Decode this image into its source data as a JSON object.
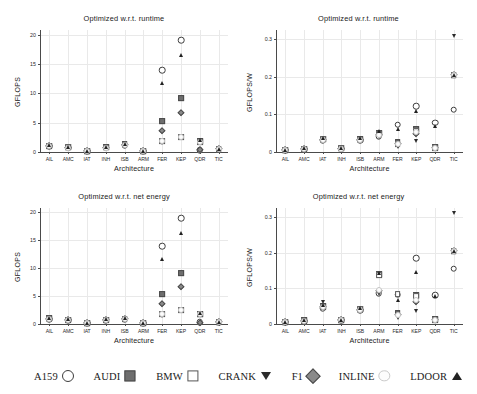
{
  "figure": {
    "width": 477,
    "height": 394,
    "xlabel": "Architecture",
    "categories": [
      "AIL",
      "AMC",
      "IAT",
      "INH",
      "ISB",
      "ARM",
      "FER",
      "KEP",
      "QDR",
      "TIC"
    ],
    "series_names": [
      "A159",
      "AUDI",
      "BMW",
      "CRANK",
      "F1",
      "INLINE",
      "LDOOR"
    ],
    "markers": {
      "A159": "open-circle",
      "AUDI": "gray-square",
      "BMW": "white-square",
      "CRANK": "filled-down-triangle",
      "F1": "gray-diamond",
      "INLINE": "white-circle",
      "LDOOR": "filled-up-triangle"
    },
    "colors": {
      "open_circle": "#ffffff",
      "open_circle_edge": "#3d3d3d",
      "gray_square": "#6e6e6e",
      "white_square": "#ffffff",
      "down_triangle": "#2b2b2b",
      "diamond": "#8a8a8a",
      "inline": "#fdfdfd",
      "up_triangle": "#222222",
      "grid": "#e9e9e9",
      "axis": "#4a4a4a",
      "text": "#1a1a1a"
    }
  },
  "legend": {
    "items": [
      {
        "label": "A159",
        "marker": "open-circle"
      },
      {
        "label": "AUDI",
        "marker": "gray-square"
      },
      {
        "label": "BMW",
        "marker": "white-square"
      },
      {
        "label": "CRANK",
        "marker": "filled-down-triangle"
      },
      {
        "label": "F1",
        "marker": "gray-diamond"
      },
      {
        "label": "INLINE",
        "marker": "white-circle"
      },
      {
        "label": "LDOOR",
        "marker": "filled-up-triangle"
      }
    ]
  },
  "chart_data": [
    {
      "id": "top-left",
      "type": "scatter",
      "title": "Optimized w.r.t. runtime",
      "xlabel": "Architecture",
      "ylabel": "GFLOPS",
      "categories": [
        "AIL",
        "AMC",
        "IAT",
        "INH",
        "ISB",
        "ARM",
        "FER",
        "KEP",
        "QDR",
        "TIC"
      ],
      "ylim": [
        0,
        20.8
      ],
      "yticks": [
        0,
        5,
        10,
        15,
        20
      ],
      "ytick_labels": [
        "0",
        "5",
        "10",
        "15",
        "20"
      ],
      "grid": true,
      "legend_position": "below-figure",
      "series": [
        {
          "name": "A159",
          "values": [
            1.0,
            0.75,
            0.15,
            0.7,
            1.2,
            0.12,
            13.9,
            19.1,
            0.35,
            0.55
          ]
        },
        {
          "name": "AUDI",
          "values": [
            1.1,
            0.8,
            0.2,
            0.8,
            1.3,
            0.15,
            5.3,
            9.2,
            1.8,
            0.5
          ]
        },
        {
          "name": "BMW",
          "values": [
            1.05,
            0.78,
            0.18,
            0.75,
            1.25,
            0.14,
            1.9,
            2.6,
            1.7,
            0.45
          ]
        },
        {
          "name": "CRANK",
          "values": [
            0.9,
            0.7,
            0.12,
            0.65,
            1.1,
            0.1,
            1.55,
            2.45,
            0.3,
            0.6
          ]
        },
        {
          "name": "F1",
          "values": [
            1.0,
            0.75,
            0.15,
            0.7,
            1.2,
            0.12,
            3.6,
            6.7,
            0.3,
            0.5
          ]
        },
        {
          "name": "INLINE",
          "values": [
            1.0,
            0.75,
            0.15,
            0.7,
            1.2,
            0.12,
            1.85,
            2.5,
            1.75,
            0.5
          ]
        },
        {
          "name": "LDOOR",
          "values": [
            1.15,
            0.85,
            0.2,
            0.8,
            1.4,
            0.15,
            11.7,
            16.5,
            2.0,
            0.5
          ]
        }
      ]
    },
    {
      "id": "top-right",
      "type": "scatter",
      "title": "Optimized w.r.t. runtime",
      "xlabel": "Architecture",
      "ylabel": "GFLOPS/W",
      "categories": [
        "AIL",
        "AMC",
        "IAT",
        "INH",
        "ISB",
        "ARM",
        "FER",
        "KEP",
        "QDR",
        "TIC"
      ],
      "ylim": [
        0,
        0.325
      ],
      "yticks": [
        0,
        0.1,
        0.2,
        0.3
      ],
      "ytick_labels": [
        "0",
        "0.1",
        "0.2",
        "0.3"
      ],
      "grid": true,
      "legend_position": "below-figure",
      "series": [
        {
          "name": "A159",
          "values": [
            0.004,
            0.007,
            0.032,
            0.009,
            0.031,
            0.042,
            0.073,
            0.122,
            0.078,
            0.113
          ]
        },
        {
          "name": "AUDI",
          "values": [
            0.005,
            0.009,
            0.035,
            0.01,
            0.034,
            0.051,
            0.027,
            0.06,
            0.012,
            0.205
          ]
        },
        {
          "name": "BMW",
          "values": [
            0.005,
            0.008,
            0.034,
            0.01,
            0.033,
            0.049,
            0.022,
            0.055,
            0.011,
            0.205
          ]
        },
        {
          "name": "CRANK",
          "values": [
            0.004,
            0.007,
            0.031,
            0.008,
            0.03,
            0.04,
            0.012,
            0.028,
            0.008,
            0.31
          ]
        },
        {
          "name": "F1",
          "values": [
            0.004,
            0.008,
            0.033,
            0.009,
            0.032,
            0.045,
            0.02,
            0.047,
            0.01,
            0.205
          ]
        },
        {
          "name": "INLINE",
          "values": [
            0.004,
            0.008,
            0.033,
            0.009,
            0.032,
            0.046,
            0.021,
            0.052,
            0.01,
            0.205
          ]
        },
        {
          "name": "LDOOR",
          "values": [
            0.006,
            0.01,
            0.037,
            0.011,
            0.036,
            0.055,
            0.06,
            0.108,
            0.07,
            0.205
          ]
        }
      ]
    },
    {
      "id": "bottom-left",
      "type": "scatter",
      "title": "Optimized w.r.t. net energy",
      "xlabel": "Architecture",
      "ylabel": "GFLOPS",
      "categories": [
        "AIL",
        "AMC",
        "IAT",
        "INH",
        "ISB",
        "ARM",
        "FER",
        "KEP",
        "QDR",
        "TIC"
      ],
      "ylim": [
        0,
        20.8
      ],
      "yticks": [
        0,
        5,
        10,
        15,
        20
      ],
      "ytick_labels": [
        "0",
        "5",
        "10",
        "15",
        "20"
      ],
      "grid": true,
      "legend_position": "below-figure",
      "series": [
        {
          "name": "A159",
          "values": [
            0.9,
            0.7,
            0.15,
            0.7,
            0.85,
            0.12,
            13.9,
            19.0,
            0.3,
            0.35
          ]
        },
        {
          "name": "AUDI",
          "values": [
            1.0,
            0.8,
            0.2,
            0.8,
            0.95,
            0.16,
            5.3,
            9.1,
            1.8,
            0.4
          ]
        },
        {
          "name": "BMW",
          "values": [
            0.95,
            0.75,
            0.18,
            0.75,
            0.9,
            0.15,
            1.8,
            2.5,
            1.7,
            0.35
          ]
        },
        {
          "name": "CRANK",
          "values": [
            0.85,
            0.68,
            0.12,
            0.65,
            0.8,
            0.1,
            1.5,
            2.4,
            0.25,
            0.4
          ]
        },
        {
          "name": "F1",
          "values": [
            0.9,
            0.7,
            0.15,
            0.7,
            0.85,
            0.12,
            3.6,
            6.6,
            0.25,
            0.35
          ]
        },
        {
          "name": "INLINE",
          "values": [
            0.9,
            0.72,
            0.16,
            0.72,
            0.88,
            0.13,
            1.85,
            2.45,
            1.75,
            0.35
          ]
        },
        {
          "name": "LDOOR",
          "values": [
            1.05,
            0.82,
            0.2,
            0.82,
            1.0,
            0.16,
            11.6,
            16.4,
            1.95,
            0.4
          ]
        }
      ]
    },
    {
      "id": "bottom-right",
      "type": "scatter",
      "title": "Optimized w.r.t. net energy",
      "xlabel": "Architecture",
      "ylabel": "GFLOPS/W",
      "categories": [
        "AIL",
        "AMC",
        "IAT",
        "INH",
        "ISB",
        "ARM",
        "FER",
        "KEP",
        "QDR",
        "TIC"
      ],
      "ylim": [
        0,
        0.325
      ],
      "yticks": [
        0,
        0.1,
        0.2,
        0.3
      ],
      "ytick_labels": [
        "0",
        "0.1",
        "0.2",
        "0.3"
      ],
      "grid": true,
      "legend_position": "below-figure",
      "series": [
        {
          "name": "A159",
          "values": [
            0.005,
            0.008,
            0.045,
            0.01,
            0.039,
            0.086,
            0.082,
            0.185,
            0.08,
            0.155
          ]
        },
        {
          "name": "AUDI",
          "values": [
            0.006,
            0.01,
            0.05,
            0.011,
            0.042,
            0.14,
            0.03,
            0.082,
            0.013,
            0.205
          ]
        },
        {
          "name": "BMW",
          "values": [
            0.006,
            0.009,
            0.048,
            0.011,
            0.041,
            0.138,
            0.083,
            0.078,
            0.012,
            0.205
          ]
        },
        {
          "name": "CRANK",
          "values": [
            0.005,
            0.008,
            0.062,
            0.009,
            0.038,
            0.085,
            0.018,
            0.037,
            0.009,
            0.31
          ]
        },
        {
          "name": "F1",
          "values": [
            0.005,
            0.009,
            0.047,
            0.01,
            0.04,
            0.092,
            0.024,
            0.062,
            0.011,
            0.205
          ]
        },
        {
          "name": "INLINE",
          "values": [
            0.005,
            0.009,
            0.047,
            0.01,
            0.04,
            0.095,
            0.026,
            0.066,
            0.011,
            0.205
          ]
        },
        {
          "name": "LDOOR",
          "values": [
            0.007,
            0.011,
            0.052,
            0.012,
            0.044,
            0.142,
            0.068,
            0.145,
            0.078,
            0.205
          ]
        }
      ]
    }
  ]
}
